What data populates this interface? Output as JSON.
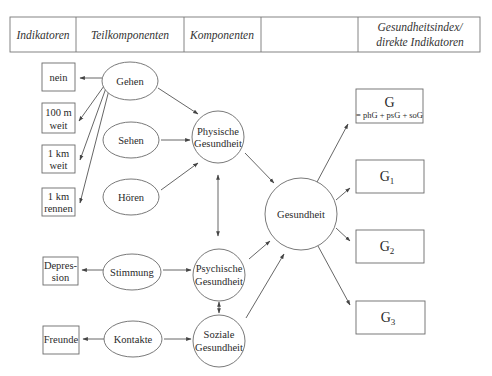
{
  "header": {
    "columns": [
      {
        "label": "Indikatoren"
      },
      {
        "label": "Teilkomponenten"
      },
      {
        "label": "Komponenten"
      },
      {
        "label": ""
      },
      {
        "label_line1": "Gesundheitsindex/",
        "label_line2": "direkte Indikatoren"
      }
    ]
  },
  "indicators": [
    {
      "line1": "nein",
      "line2": ""
    },
    {
      "line1": "100 m",
      "line2": "weit"
    },
    {
      "line1": "1 km",
      "line2": "weit"
    },
    {
      "line1": "1 km",
      "line2": "rennen"
    },
    {
      "line1": "Depres-",
      "line2": "sion"
    },
    {
      "line1": "Freunde",
      "line2": ""
    }
  ],
  "subcomponents": [
    {
      "label": "Gehen"
    },
    {
      "label": "Sehen"
    },
    {
      "label": "Hören"
    },
    {
      "label": "Stimmung"
    },
    {
      "label": "Kontakte"
    }
  ],
  "components": [
    {
      "line1": "Physische",
      "line2": "Gesundheit"
    },
    {
      "line1": "Psychische",
      "line2": "Gesundheit"
    },
    {
      "line1": "Soziale",
      "line2": "Gesundheit"
    }
  ],
  "central": {
    "label": "Gesundheit"
  },
  "indices": [
    {
      "main": "G",
      "sub": "",
      "formula": "= phG + psG + soG"
    },
    {
      "main": "G",
      "sub": "1",
      "formula": ""
    },
    {
      "main": "G",
      "sub": "2",
      "formula": ""
    },
    {
      "main": "G",
      "sub": "3",
      "formula": ""
    }
  ]
}
